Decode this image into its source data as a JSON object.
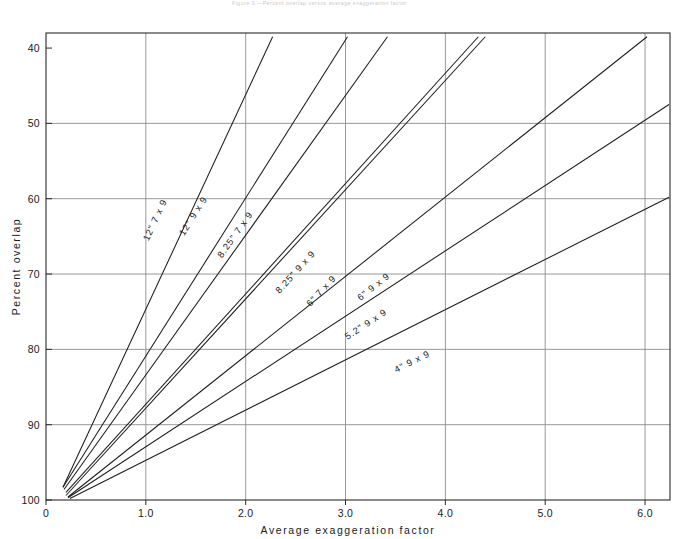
{
  "figure": {
    "header_note": "Figure 3.—Percent overlap versus average exaggeration factor",
    "background": "#ffffff",
    "line_color": "#1d1d1d",
    "grid_color": "#8d8d8d",
    "axis_color": "#2b2b2b"
  },
  "chart_data": {
    "type": "line",
    "title": "",
    "xlabel": "Average exaggeration factor",
    "ylabel": "Percent overlap",
    "xlim": [
      0,
      6.25
    ],
    "ylim": [
      100,
      38
    ],
    "y_inverted": true,
    "grid": true,
    "legend": "inline-labels",
    "xticks": [
      "0",
      "1.0",
      "2.0",
      "3.0",
      "4.0",
      "5.0",
      "6.0"
    ],
    "xtick_values": [
      0,
      1.0,
      2.0,
      3.0,
      4.0,
      5.0,
      6.0
    ],
    "yticks": [
      "40",
      "50",
      "60",
      "70",
      "80",
      "90",
      "100"
    ],
    "ytick_values": [
      40,
      50,
      60,
      70,
      80,
      90,
      100
    ],
    "series": [
      {
        "name": "12\" 7 x 9",
        "label": "12\"  7 x 9",
        "x": [
          0.17,
          2.27
        ],
        "y": [
          98.3,
          38.5
        ],
        "label_x": 1.12,
        "label_y": 63.0
      },
      {
        "name": "12\" 9 x 9",
        "label": "12\"  9 x 9",
        "x": [
          0.17,
          3.02
        ],
        "y": [
          98.3,
          38.5
        ],
        "label_x": 1.5,
        "label_y": 62.5
      },
      {
        "name": "8.25\" 7 x 9",
        "label": "8.25\"  7 x 9",
        "x": [
          0.18,
          3.42
        ],
        "y": [
          98.6,
          38.5
        ],
        "label_x": 1.92,
        "label_y": 65.0
      },
      {
        "name": "8.25\" 9 x 9",
        "label": "8.25\"  9 x 9",
        "x": [
          0.2,
          4.33
        ],
        "y": [
          99.0,
          38.5
        ],
        "label_x": 2.52,
        "label_y": 70.0
      },
      {
        "name": "6\" 7 x 9",
        "label": "6\"  7 x 9",
        "x": [
          0.2,
          4.4
        ],
        "y": [
          99.4,
          38.5
        ],
        "label_x": 2.78,
        "label_y": 72.5
      },
      {
        "name": "6\" 9 x 9",
        "label": "6\"  9 x 9",
        "x": [
          0.22,
          6.02
        ],
        "y": [
          99.6,
          38.5
        ],
        "label_x": 3.3,
        "label_y": 72.0
      },
      {
        "name": "5.2\" 9 x 9",
        "label": "5.2\"  9 x 9",
        "x": [
          0.22,
          6.24
        ],
        "y": [
          99.7,
          47.5
        ],
        "label_x": 3.22,
        "label_y": 77.0
      },
      {
        "name": "4\" 9 x 9",
        "label": "4\"  9 x 9",
        "x": [
          0.24,
          6.24
        ],
        "y": [
          99.8,
          59.8
        ],
        "label_x": 3.68,
        "label_y": 82.0
      }
    ]
  }
}
